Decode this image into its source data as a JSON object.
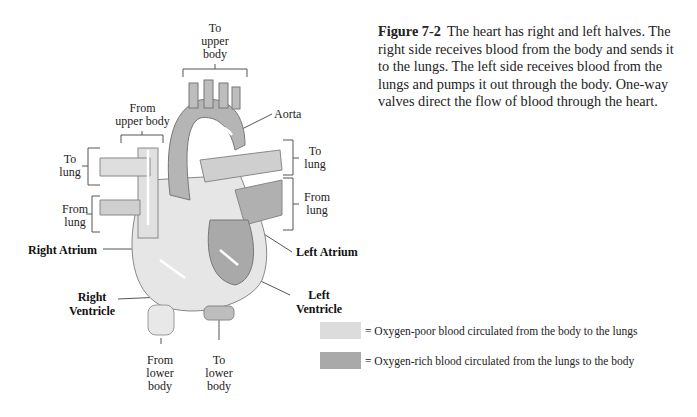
{
  "figure": {
    "number": "Figure 7-2",
    "caption": "The heart has right and left halves. The right side receives blood from the body and sends it to the lungs. The left side receives blood from the lungs and pumps it out through the body. One-way valves direct the flow of blood through the heart."
  },
  "labels": {
    "to_upper_body": [
      "To",
      "upper",
      "body"
    ],
    "from_upper_body": [
      "From",
      "upper body"
    ],
    "aorta": "Aorta",
    "to_lung_left": [
      "To",
      "lung"
    ],
    "to_lung_right": [
      "To",
      "lung"
    ],
    "from_lung_left": [
      "From",
      "lung"
    ],
    "from_lung_right": [
      "From",
      "lung"
    ],
    "right_atrium": "Right Atrium",
    "left_atrium": "Left Atrium",
    "right_ventricle": [
      "Right",
      "Ventricle"
    ],
    "left_ventricle": [
      "Left",
      "Ventricle"
    ],
    "from_lower_body": [
      "From",
      "lower",
      "body"
    ],
    "to_lower_body": [
      "To",
      "lower",
      "body"
    ]
  },
  "legend": [
    {
      "color": "#dcdcdc",
      "text": "= Oxygen-poor blood circulated from the body to the lungs"
    },
    {
      "color": "#a9a9a9",
      "text": "= Oxygen-rich blood circulated from the lungs to the body"
    }
  ]
}
